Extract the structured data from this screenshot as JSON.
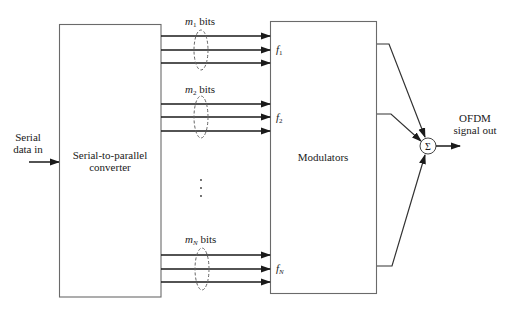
{
  "figure": {
    "input": {
      "label_line1": "Serial",
      "label_line2": "data in"
    },
    "converter": {
      "label_line1": "Serial-to-parallel",
      "label_line2": "converter"
    },
    "modulators": {
      "label": "Modulators"
    },
    "groups": [
      {
        "bits_var": "m",
        "bits_sub": "1",
        "bits_suffix": " bits",
        "freq_var": "f",
        "freq_sub": "1"
      },
      {
        "bits_var": "m",
        "bits_sub": "2",
        "bits_suffix": " bits",
        "freq_var": "f",
        "freq_sub": "2"
      },
      {
        "bits_var": "m",
        "bits_sub": "N",
        "bits_suffix": " bits",
        "freq_var": "f",
        "freq_sub": "N"
      }
    ],
    "ellipsis": "⋮",
    "summer": {
      "symbol": "Σ"
    },
    "output": {
      "label_line1": "OFDM",
      "label_line2": "signal out"
    }
  },
  "colors": {
    "line": "#1a1a1a",
    "box": "#6a6a6a",
    "dash": "#666666",
    "background": "#ffffff"
  }
}
